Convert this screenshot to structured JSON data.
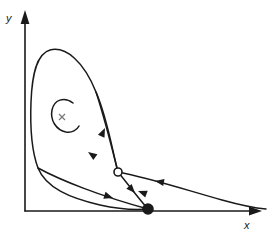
{
  "figure": {
    "kind": "phase-portrait",
    "title": "",
    "background_color": "#ffffff",
    "stroke_color": "#1a1a1a",
    "width": 271,
    "height": 237
  },
  "axes": {
    "x_label": "x",
    "y_label": "y",
    "origin": {
      "x": 25,
      "y": 211
    },
    "x_axis": {
      "from_x": 25,
      "to_x": 262,
      "y": 211,
      "arrow": "right-arrow"
    },
    "y_axis": {
      "x": 25,
      "from_y": 211,
      "to_y": 10,
      "arrow": "up-arrow"
    },
    "ticks": [],
    "gridlines": false
  },
  "chart_data": {
    "type": "line",
    "title": "",
    "xlabel": "x",
    "ylabel": "y",
    "grid": false,
    "legend": "none",
    "xlim": [
      0,
      262
    ],
    "ylim": [
      0,
      211
    ],
    "fixed_points": [
      {
        "name": "saddle-point",
        "marker": "open-circle",
        "x": 118,
        "y": 172,
        "radius": 4,
        "fill": "#ffffff",
        "stroke": "#1a1a1a"
      },
      {
        "name": "stable-node",
        "marker": "filled-circle",
        "x": 148,
        "y": 209,
        "radius": 5,
        "fill": "#1a1a1a",
        "stroke": "#1a1a1a"
      },
      {
        "name": "unstable-spiral-focus",
        "marker": "cross",
        "x": 62,
        "y": 117,
        "size": 6,
        "stroke": "#7a7a7a"
      }
    ],
    "trajectories": [
      {
        "name": "outer-separatrix-loop",
        "path": "M 118 172 C 112 150 108 120 96 92 C 84 62 66 46 50 50 C 36 54 32 76 31 102 C 30 128 32 152 38 168 C 46 188 70 198 100 205 C 118 209 136 210 148 209"
      },
      {
        "name": "inner-spiral-arc",
        "path": "M 73 103 C 64 96 54 100 52 110 C 50 120 56 130 66 132 C 72 133 77 130 79 126"
      },
      {
        "name": "incoming-branch-upper-left",
        "path": "M 96 92 C 102 110 110 140 118 172"
      },
      {
        "name": "outgoing-branch-to-node",
        "path": "M 118 172 C 128 184 138 198 148 209"
      },
      {
        "name": "asymptotic-right-tail",
        "path": "M 118 172 C 150 178 186 190 222 200 C 240 205 254 208 266 209"
      },
      {
        "name": "lower-incoming-branch",
        "path": "M 38 168 C 60 180 100 196 148 209"
      }
    ],
    "direction_arrows": [
      {
        "name": "arrow-up-left-branch",
        "x": 105,
        "y": 128,
        "angle": -65
      },
      {
        "name": "arrow-down-left-branch",
        "x": 88,
        "y": 152,
        "angle": 215
      },
      {
        "name": "arrow-toward-saddle-right",
        "x": 155,
        "y": 181,
        "angle": 190
      },
      {
        "name": "arrow-toward-saddle-lower",
        "x": 138,
        "y": 191,
        "angle": 200
      },
      {
        "name": "arrow-toward-node-lower",
        "x": 113,
        "y": 198,
        "angle": 18
      },
      {
        "name": "arrow-toward-node-upper",
        "x": 135,
        "y": 193,
        "angle": 48
      }
    ]
  }
}
